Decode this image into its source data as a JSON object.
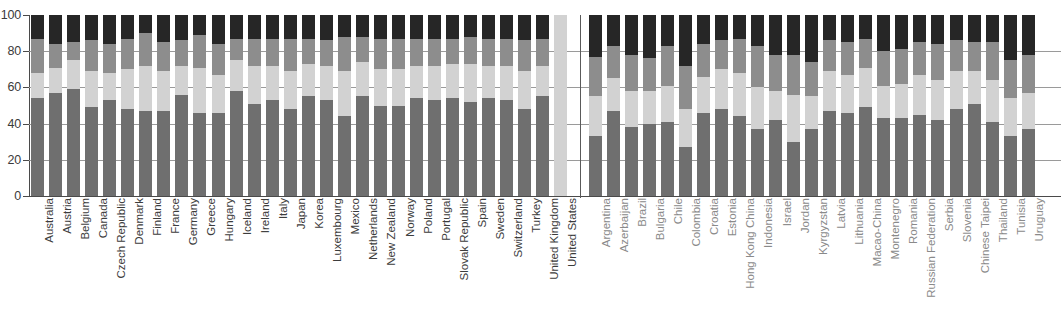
{
  "chart_data": {
    "type": "bar",
    "subtype": "stacked-bar-100",
    "title": "",
    "subtitle": "",
    "xlabel": "",
    "ylabel": "",
    "ylim": [
      0,
      100
    ],
    "yticks": [
      0,
      20,
      40,
      60,
      80,
      100
    ],
    "grid": true,
    "legend": "none",
    "stack_order": "bottom-to-top",
    "series": [
      {
        "name": "segment-1",
        "color": "#6f6f6f"
      },
      {
        "name": "segment-2",
        "color": "#d2d2d2"
      },
      {
        "name": "segment-3",
        "color": "#8d8d8d"
      },
      {
        "name": "segment-4",
        "color": "#262626"
      }
    ],
    "groups": [
      {
        "name": "OECD countries",
        "categories": [
          "Australia",
          "Austria",
          "Belgium",
          "Canada",
          "Czech Republic",
          "Denmark",
          "Finland",
          "France",
          "Germany",
          "Greece",
          "Hungary",
          "Iceland",
          "Ireland",
          "Italy",
          "Japan",
          "Korea",
          "Luxembourg",
          "Mexico",
          "Netherlands",
          "New Zealand",
          "Norway",
          "Poland",
          "Portugal",
          "Slovak Republic",
          "Spain",
          "Sweden",
          "Switzerland",
          "Turkey",
          "United Kingdom",
          "United States"
        ],
        "values": [
          [
            54,
            14,
            19,
            13
          ],
          [
            57,
            14,
            13,
            16
          ],
          [
            59,
            16,
            10,
            15
          ],
          [
            49,
            20,
            17,
            14
          ],
          [
            53,
            15,
            16,
            16
          ],
          [
            48,
            22,
            17,
            13
          ],
          [
            47,
            25,
            18,
            10
          ],
          [
            47,
            22,
            16,
            15
          ],
          [
            56,
            16,
            14,
            14
          ],
          [
            46,
            25,
            18,
            11
          ],
          [
            46,
            21,
            17,
            16
          ],
          [
            58,
            17,
            12,
            13
          ],
          [
            51,
            21,
            15,
            13
          ],
          [
            53,
            19,
            15,
            13
          ],
          [
            48,
            21,
            18,
            13
          ],
          [
            55,
            18,
            14,
            13
          ],
          [
            53,
            19,
            14,
            14
          ],
          [
            44,
            25,
            19,
            12
          ],
          [
            55,
            19,
            14,
            12
          ],
          [
            50,
            20,
            17,
            13
          ],
          [
            50,
            20,
            17,
            13
          ],
          [
            54,
            18,
            15,
            13
          ],
          [
            53,
            19,
            15,
            13
          ],
          [
            54,
            19,
            14,
            13
          ],
          [
            52,
            21,
            15,
            12
          ],
          [
            54,
            18,
            15,
            13
          ],
          [
            53,
            19,
            15,
            13
          ],
          [
            48,
            21,
            17,
            14
          ],
          [
            55,
            17,
            15,
            13
          ],
          [
            0,
            100,
            0,
            0
          ]
        ]
      },
      {
        "name": "Partner countries and economies",
        "categories": [
          "Argentina",
          "Azerbaijan",
          "Brazil",
          "Bulgaria",
          "Chile",
          "Colombia",
          "Croatia",
          "Estonia",
          "Hong Kong China",
          "Indonesia",
          "Israel",
          "Jordan",
          "Kyrgyzstan",
          "Latvia",
          "Lithuania",
          "Macao-China",
          "Montenegro",
          "Romania",
          "Russian Federation",
          "Serbia",
          "Slovenia",
          "Chinese Taipei",
          "Thailand",
          "Tunisia",
          "Uruguay"
        ],
        "values": [
          [
            33,
            22,
            22,
            23
          ],
          [
            47,
            18,
            18,
            17
          ],
          [
            38,
            20,
            20,
            22
          ],
          [
            40,
            18,
            18,
            24
          ],
          [
            41,
            20,
            22,
            17
          ],
          [
            27,
            21,
            24,
            28
          ],
          [
            46,
            20,
            18,
            16
          ],
          [
            48,
            22,
            16,
            14
          ],
          [
            44,
            24,
            19,
            13
          ],
          [
            37,
            23,
            23,
            17
          ],
          [
            42,
            16,
            20,
            22
          ],
          [
            30,
            26,
            22,
            22
          ],
          [
            37,
            18,
            19,
            26
          ],
          [
            47,
            22,
            17,
            14
          ],
          [
            46,
            21,
            18,
            15
          ],
          [
            49,
            22,
            16,
            13
          ],
          [
            43,
            18,
            19,
            20
          ],
          [
            43,
            19,
            19,
            19
          ],
          [
            45,
            22,
            18,
            15
          ],
          [
            42,
            22,
            20,
            16
          ],
          [
            48,
            21,
            17,
            14
          ],
          [
            51,
            18,
            16,
            15
          ],
          [
            41,
            23,
            21,
            15
          ],
          [
            33,
            21,
            21,
            25
          ],
          [
            37,
            20,
            21,
            22
          ]
        ]
      }
    ]
  },
  "axis": {
    "y_tick_labels": [
      "100",
      "80",
      "60",
      "40",
      "20",
      "0"
    ]
  }
}
